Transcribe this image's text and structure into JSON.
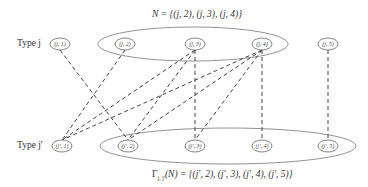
{
  "top_set_label": "N = {(j, 2), (j, 3), (j, 4)}",
  "bottom_set_label": "Γ_{j,j'}(N) = {(j', 2), (j', 3), (j', 4), (j', 5)}",
  "bottom_set_label_parts": {
    "gamma": "Γ",
    "sub": "j, j'",
    "rest": "(N) = {(j', 2), (j', 3), (j', 4), (j', 5)}"
  },
  "row_labels": {
    "top": "Type j",
    "bottom": "Type j'"
  },
  "top_nodes": [
    {
      "id": "j1",
      "label": "(j, 1)",
      "x": 60
    },
    {
      "id": "j2",
      "label": "(j, 2)",
      "x": 125
    },
    {
      "id": "j3",
      "label": "(j, 3)",
      "x": 195
    },
    {
      "id": "j4",
      "label": "(j, 4)",
      "x": 262
    },
    {
      "id": "j5",
      "label": "(j, 5)",
      "x": 328
    }
  ],
  "bottom_nodes": [
    {
      "id": "jp1",
      "label": "(j', 1)",
      "x": 62
    },
    {
      "id": "jp2",
      "label": "(j', 2)",
      "x": 128
    },
    {
      "id": "jp3",
      "label": "(j', 3)",
      "x": 195
    },
    {
      "id": "jp4",
      "label": "(j', 4)",
      "x": 262
    },
    {
      "id": "jp5",
      "label": "(j', 5)",
      "x": 328
    }
  ],
  "edges": [
    [
      "j1",
      "jp2"
    ],
    [
      "j2",
      "jp1"
    ],
    [
      "j3",
      "jp1"
    ],
    [
      "j4",
      "jp1"
    ],
    [
      "j3",
      "jp2"
    ],
    [
      "j4",
      "jp2"
    ],
    [
      "j3",
      "jp3"
    ],
    [
      "j4",
      "jp3"
    ],
    [
      "j4",
      "jp4"
    ],
    [
      "j5",
      "jp5"
    ]
  ],
  "colors": {
    "line": "#444444",
    "ellipse": "#777777",
    "text": "#333333"
  }
}
